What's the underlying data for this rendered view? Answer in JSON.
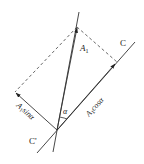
{
  "diagram": {
    "type": "vector-projection",
    "labels": {
      "vector": "A",
      "vector_sub": "1",
      "axis_end": "C",
      "axis_start": "C'",
      "angle": "α",
      "sin_component": "A",
      "sin_sub": "1",
      "sin_text": "sinα",
      "cos_component": "A",
      "cos_sub": "1",
      "cos_text": "cosα"
    },
    "colors": {
      "line": "#333333",
      "background": "#ffffff"
    }
  }
}
